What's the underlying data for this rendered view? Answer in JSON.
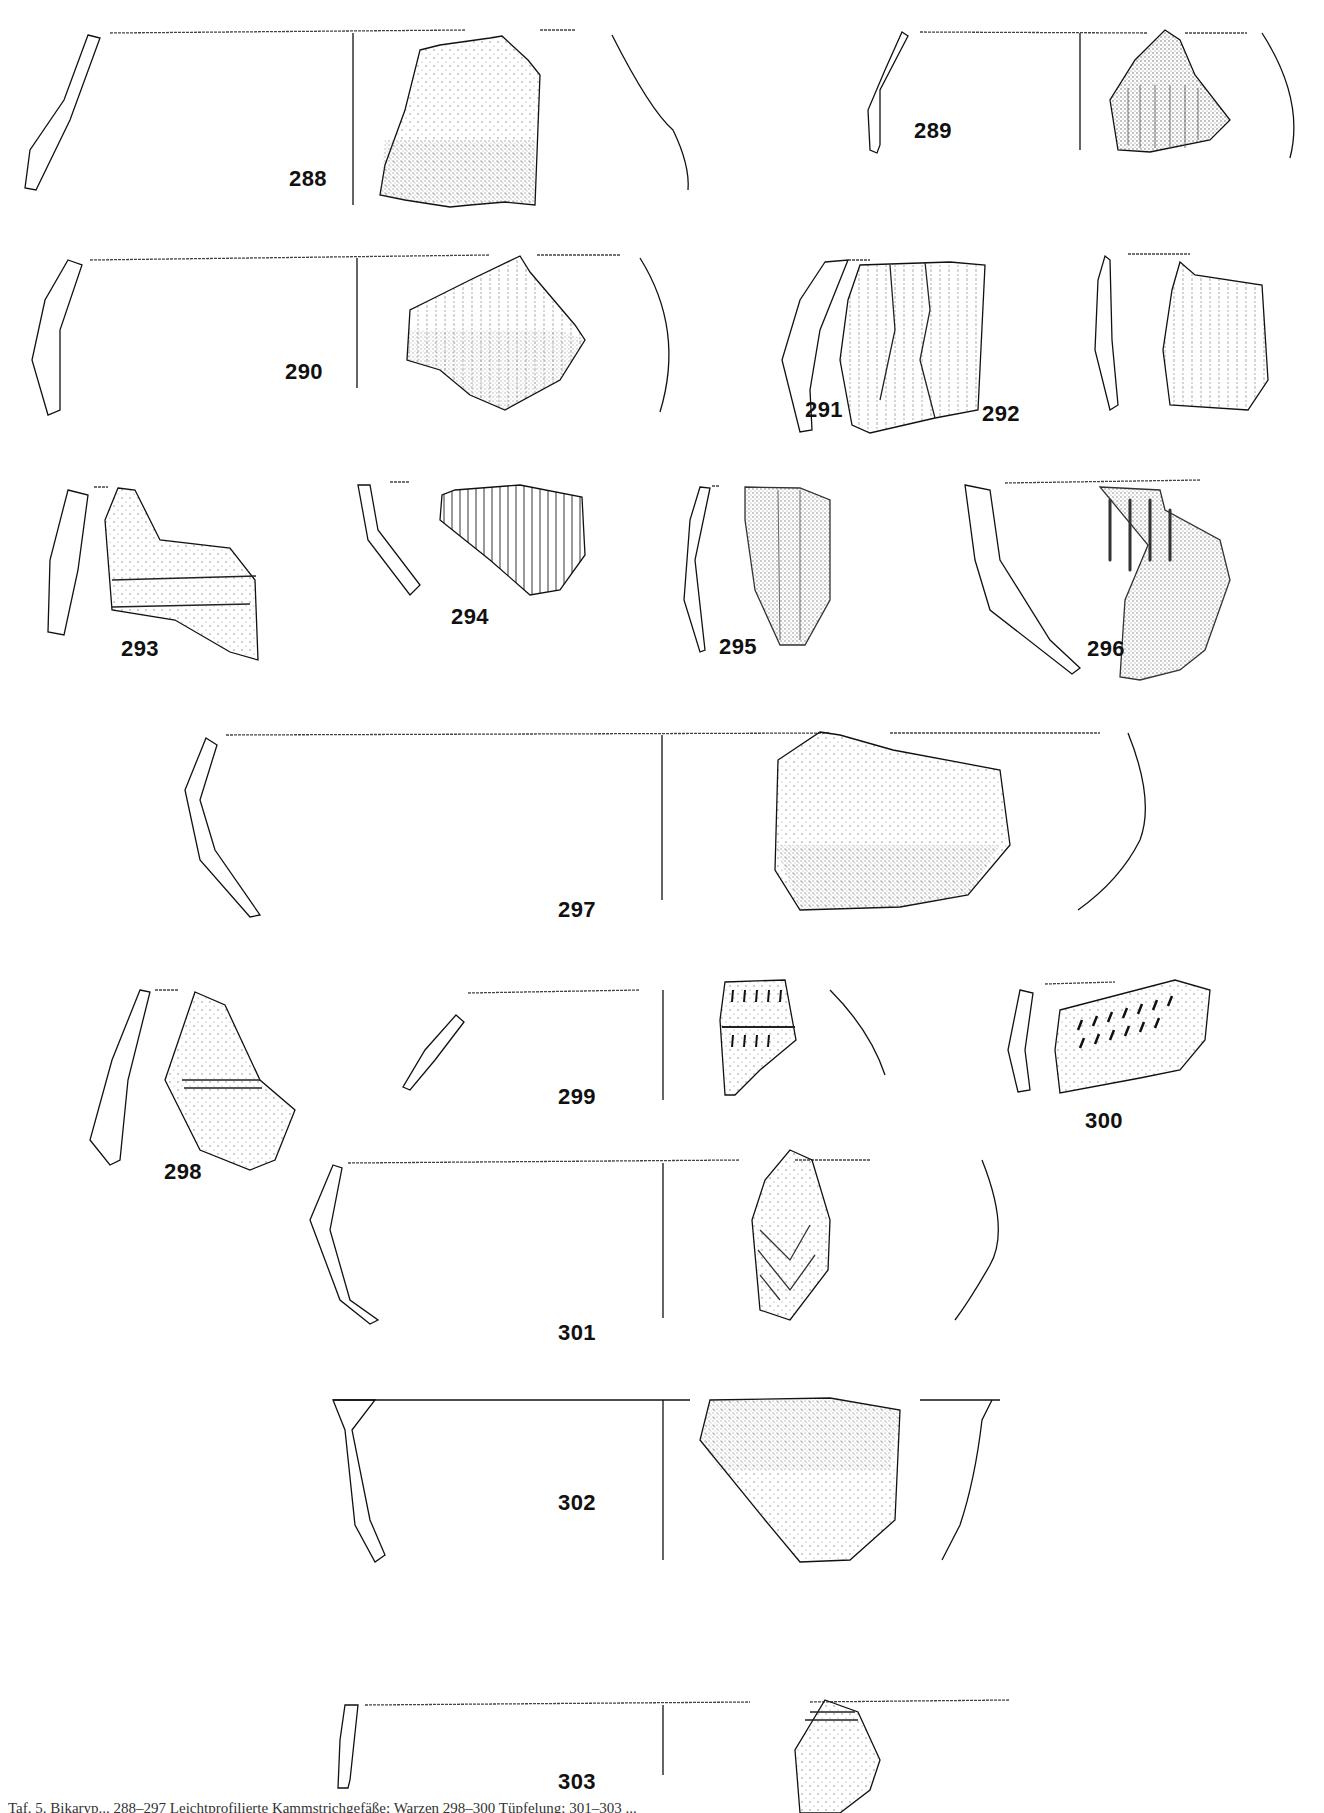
{
  "plate": {
    "type": "archaeological pottery plate (sherd drawings with profiles)",
    "background": "#ffffff",
    "ink": "#111111",
    "figures": [
      {
        "number": "288",
        "label_x": 308,
        "label_y": 182
      },
      {
        "number": "289",
        "label_x": 933,
        "label_y": 134
      },
      {
        "number": "290",
        "label_x": 304,
        "label_y": 375
      },
      {
        "number": "291",
        "label_x": 824,
        "label_y": 413
      },
      {
        "number": "292",
        "label_x": 1001,
        "label_y": 417
      },
      {
        "number": "293",
        "label_x": 140,
        "label_y": 652
      },
      {
        "number": "294",
        "label_x": 470,
        "label_y": 620
      },
      {
        "number": "295",
        "label_x": 738,
        "label_y": 650
      },
      {
        "number": "296",
        "label_x": 1106,
        "label_y": 652
      },
      {
        "number": "297",
        "label_x": 577,
        "label_y": 913
      },
      {
        "number": "298",
        "label_x": 183,
        "label_y": 1175
      },
      {
        "number": "299",
        "label_x": 577,
        "label_y": 1100
      },
      {
        "number": "300",
        "label_x": 1104,
        "label_y": 1124
      },
      {
        "number": "301",
        "label_x": 577,
        "label_y": 1336
      },
      {
        "number": "302",
        "label_x": 577,
        "label_y": 1506
      },
      {
        "number": "303",
        "label_x": 577,
        "label_y": 1785
      }
    ]
  },
  "caption": {
    "text": "Taf. 5. Bikaryp... 288–297 Leichtprofilierte Kammstrichgefäße; Warzen 298–300 Tüpfelung; 301–303 ..."
  }
}
